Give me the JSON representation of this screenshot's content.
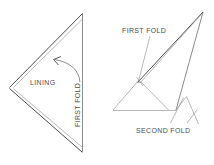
{
  "figure": {
    "title": "",
    "background_color": "#ffffff",
    "line_color": "#6f6f6f",
    "text_color": "#4d4d4d"
  },
  "left_figure": {
    "name": "folded-triangle-left",
    "labels": {
      "lining": "LINING",
      "first_fold": "FIRST FOLD"
    }
  },
  "right_figure": {
    "name": "folded-triangle-right",
    "labels": {
      "first_fold": "FIRST FOLD",
      "second_fold": "SECOND FOLD"
    }
  },
  "diagram_data": {
    "type": "line-diagram",
    "description": "Two line-drawn folding diagrams of a triangular fabric piece",
    "left_shape": {
      "outline_points": [
        [
          82,
          14
        ],
        [
          9,
          88
        ],
        [
          82,
          152
        ]
      ],
      "fold_line": [
        [
          82,
          14
        ],
        [
          82,
          152
        ]
      ],
      "inner_offset_points": [
        [
          80,
          19
        ],
        [
          13,
          88
        ],
        [
          80,
          147
        ]
      ],
      "arrow": {
        "from": [
          78,
          80
        ],
        "to": [
          52,
          60
        ],
        "head_at": [
          52,
          60
        ]
      }
    },
    "right_shape": {
      "apex": [
        203,
        12
      ],
      "outline_points": [
        [
          203,
          12
        ],
        [
          175,
          110
        ],
        [
          113,
          110
        ],
        [
          140,
          80
        ]
      ],
      "sliver_points": [
        [
          203,
          12
        ],
        [
          138,
          82
        ],
        [
          141,
          82
        ]
      ],
      "inner_triangle": [
        [
          113,
          110
        ],
        [
          140,
          80
        ],
        [
          168,
          110
        ]
      ],
      "lower_spike": [
        [
          175,
          110
        ],
        [
          186,
          97
        ],
        [
          198,
          125
        ]
      ]
    },
    "leaders": {
      "first_fold_right": [
        [
          150,
          36
        ],
        [
          139,
          81
        ]
      ],
      "second_fold_a": [
        [
          170,
          124
        ],
        [
          183,
          98
        ]
      ],
      "second_fold_b": [
        [
          186,
          124
        ],
        [
          196,
          105
        ]
      ]
    }
  }
}
